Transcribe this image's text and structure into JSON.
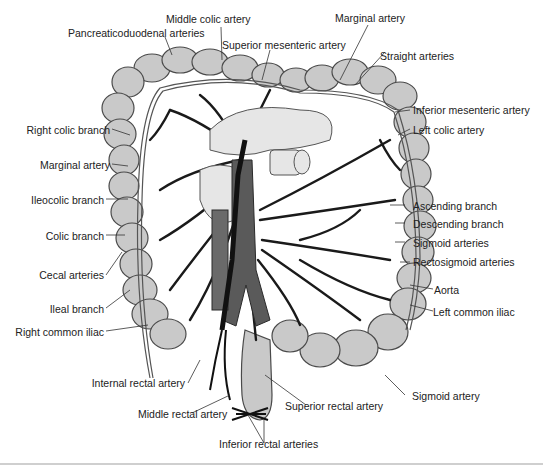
{
  "figure": {
    "colors": {
      "colon_fill": "#c9c9c9",
      "colon_stroke": "#4a4a4a",
      "artery": "#1a1a1a",
      "aorta": "#5a5a5a",
      "background": "#ffffff",
      "label_text": "#222222"
    },
    "labels": {
      "middle_colic_artery": "Middle colic artery",
      "pancreaticoduodenal_arteries": "Pancreaticoduodenal arteries",
      "superior_mesenteric_artery": "Superior mesenteric artery",
      "marginal_artery_top": "Marginal artery",
      "straight_arteries": "Straight arteries",
      "inferior_mesenteric_artery": "Inferior mesenteric artery",
      "left_colic_artery": "Left colic artery",
      "right_colic_branch": "Right colic branch",
      "marginal_artery_left": "Marginal artery",
      "ileocolic_branch": "Ileocolic branch",
      "colic_branch": "Colic branch",
      "cecal_arteries": "Cecal arteries",
      "ileal_branch": "Ileal branch",
      "right_common_iliac": "Right common iliac",
      "ascending_branch": "Ascending branch",
      "descending_branch": "Descending branch",
      "sigmoid_arteries": "Sigmoid arteries",
      "rectosigmoid_arteries": "Rectosigmoid arteries",
      "aorta": "Aorta",
      "left_common_iliac": "Left common iliac",
      "sigmoid_artery": "Sigmoid artery",
      "internal_rectal_artery": "Internal rectal artery",
      "middle_rectal_artery": "Middle rectal artery",
      "superior_rectal_artery": "Superior rectal artery",
      "inferior_rectal_arteries": "Inferior rectal arteries"
    }
  }
}
